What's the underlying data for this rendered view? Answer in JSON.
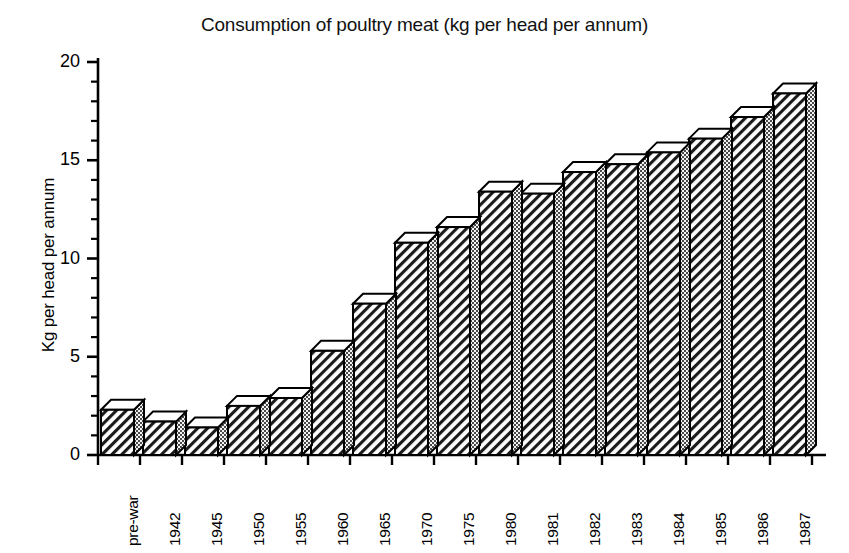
{
  "chart_data": {
    "type": "bar",
    "title": "Consumption of poultry meat (kg per head per annum)",
    "xlabel": "",
    "ylabel": "Kg per head per annum",
    "ylim": [
      0,
      20
    ],
    "ytick_labels": [
      "0",
      "5",
      "10",
      "15",
      "20"
    ],
    "ytick_values": [
      0,
      5,
      10,
      15,
      20
    ],
    "yminor_step": 1,
    "grid": false,
    "legend": null,
    "style": "3d-bars-hatched",
    "categories": [
      "pre-war",
      "1942",
      "1945",
      "1950",
      "1955",
      "1960",
      "1965",
      "1970",
      "1975",
      "1980",
      "1981",
      "1982",
      "1983",
      "1984",
      "1985",
      "1986",
      "1987"
    ],
    "values": [
      2.3,
      1.7,
      1.4,
      2.5,
      2.9,
      5.3,
      7.7,
      10.8,
      11.6,
      13.4,
      13.3,
      14.4,
      14.8,
      15.4,
      16.1,
      17.2,
      18.4
    ],
    "series": [
      {
        "name": "Poultry meat consumption",
        "values": [
          2.3,
          1.7,
          1.4,
          2.5,
          2.9,
          5.3,
          7.7,
          10.8,
          11.6,
          13.4,
          13.3,
          14.4,
          14.8,
          15.4,
          16.1,
          17.2,
          18.4
        ]
      }
    ],
    "colors": {
      "axis": "#000000",
      "bar_front": "#ffffff",
      "bar_front_hatch": "#000000",
      "bar_side": "#555555",
      "bar_top": "#ffffff",
      "background": "#ffffff"
    }
  }
}
